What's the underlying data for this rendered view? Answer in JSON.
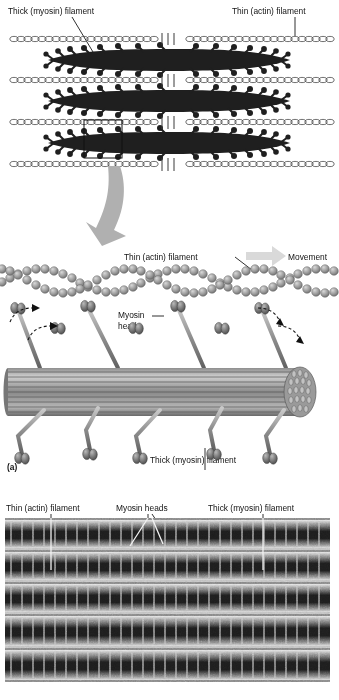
{
  "figure": {
    "panel_letter": "(a)",
    "top_diagram": {
      "name": "sarcomere-overview",
      "labels": {
        "thick": "Thick (myosin) filament",
        "thin": "Thin (actin) filament"
      },
      "thin_filament_rows": 4,
      "thick_filament_rows": 3,
      "m_line_marks": 3,
      "inset_box": {
        "x": 84,
        "y": 120,
        "w": 38,
        "h": 38
      },
      "colors": {
        "thick": "#1c1c1c",
        "thin": "#4d4d4d",
        "arrow": "#b3b3b3"
      }
    },
    "middle_diagram": {
      "name": "crossbridge-detail",
      "labels": {
        "thin": "Thin (actin) filament",
        "movement": "Movement",
        "myosin_head_line1": "Myosin",
        "myosin_head_line2": "head",
        "thick": "Thick (myosin) filament"
      },
      "actin_strands": 2,
      "myosin_heads_upper": 4,
      "myosin_heads_middle": 3,
      "myosin_heads_lower": 5,
      "motion_arrows": 4,
      "colors": {
        "actin": "#9a9a9a",
        "myosin": "#6e6e6e",
        "filament": "#808080",
        "movement_arrow": "#d9d9d9"
      }
    },
    "micrograph": {
      "name": "electron-micrograph",
      "labels": {
        "thin": "Thin (actin) filament",
        "myosin_heads": "Myosin heads",
        "thick": "Thick (myosin) filament"
      },
      "leader_count": 4,
      "sarcomere_bands": 5,
      "colors": {
        "base": "#7d7d7d",
        "dark": "#141414",
        "light": "#e6e6e6"
      }
    }
  }
}
